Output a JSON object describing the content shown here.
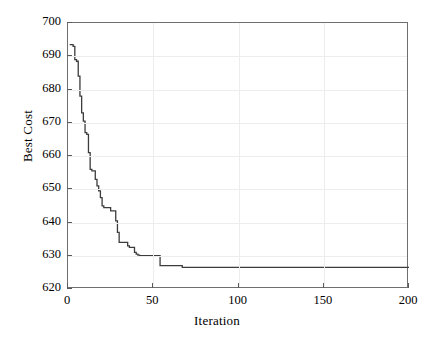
{
  "chart_data": {
    "type": "line",
    "title": "",
    "xlabel": "Iteration",
    "ylabel": "Best Cost",
    "xlim": [
      0,
      200
    ],
    "ylim": [
      620,
      700
    ],
    "xticks": [
      0,
      50,
      100,
      150,
      200
    ],
    "yticks": [
      620,
      630,
      640,
      650,
      660,
      670,
      680,
      690,
      700
    ],
    "grid": true,
    "legend": null,
    "line_color": "#3c3c3c",
    "series": [
      {
        "name": "Best Cost",
        "x": [
          1,
          2,
          3,
          4,
          5,
          6,
          7,
          8,
          9,
          10,
          11,
          12,
          13,
          14,
          15,
          16,
          17,
          18,
          19,
          20,
          21,
          22,
          23,
          24,
          25,
          26,
          27,
          28,
          29,
          30,
          31,
          32,
          33,
          34,
          35,
          36,
          37,
          38,
          39,
          40,
          41,
          42,
          43,
          44,
          45,
          46,
          47,
          48,
          49,
          50,
          51,
          52,
          53,
          54,
          55,
          56,
          57,
          58,
          59,
          60,
          61,
          62,
          63,
          64,
          65,
          66,
          67,
          68,
          69,
          70,
          200
        ],
        "y": [
          693.5,
          693.5,
          693.0,
          689.0,
          688.5,
          684.0,
          678.0,
          673.0,
          670.5,
          667.0,
          666.5,
          661.0,
          656.0,
          655.5,
          655.5,
          653.0,
          651.0,
          649.5,
          647.5,
          645.0,
          644.5,
          644.5,
          644.5,
          644.5,
          643.5,
          643.5,
          643.5,
          640.5,
          637.0,
          634.0,
          634.0,
          634.0,
          634.0,
          634.0,
          633.0,
          632.5,
          632.5,
          632.5,
          631.0,
          630.5,
          630.2,
          630.0,
          630.0,
          630.0,
          630.0,
          630.0,
          630.0,
          630.0,
          630.0,
          630.0,
          630.0,
          630.0,
          630.0,
          627.0,
          627.0,
          627.0,
          627.0,
          627.0,
          627.0,
          627.0,
          627.0,
          627.0,
          627.0,
          627.0,
          627.0,
          627.0,
          626.5,
          626.5,
          626.5,
          626.5,
          626.5
        ]
      }
    ],
    "annotations": {
      "initial_best_cost": 693.5,
      "final_best_cost": 626.5,
      "convergence_iteration": 67
    }
  },
  "axis": {
    "x_tick_labels": [
      "0",
      "50",
      "100",
      "150",
      "200"
    ],
    "y_tick_labels": [
      "620",
      "630",
      "640",
      "650",
      "660",
      "670",
      "680",
      "690",
      "700"
    ],
    "x_title": "Iteration",
    "y_title": "Best Cost"
  }
}
